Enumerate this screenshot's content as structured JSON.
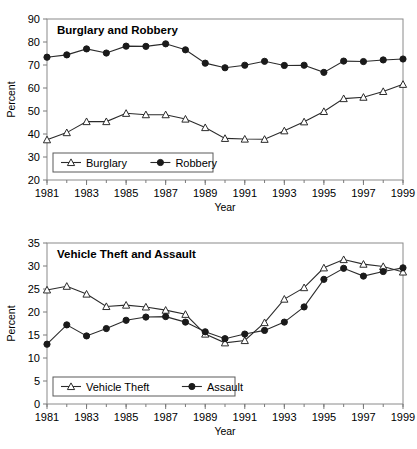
{
  "figure": {
    "background": "#ffffff",
    "width": 417,
    "height": 449,
    "line_color": "#2b2b2b",
    "marker_open_fill": "#ffffff",
    "marker_filled_fill": "#1a1a1a",
    "axis_color": "#7a7a7a"
  },
  "chart_data": [
    {
      "type": "line",
      "title": "Burglary and Robbery",
      "xlabel": "Year",
      "ylabel": "Percent",
      "x": [
        1981,
        1982,
        1983,
        1984,
        1985,
        1986,
        1987,
        1988,
        1989,
        1990,
        1991,
        1992,
        1993,
        1994,
        1995,
        1996,
        1997,
        1998,
        1999
      ],
      "xticklabels": [
        "1981",
        "1983",
        "1985",
        "1987",
        "1989",
        "1991",
        "1993",
        "1995",
        "1997",
        "1999"
      ],
      "xtickvalues": [
        1981,
        1983,
        1985,
        1987,
        1989,
        1991,
        1993,
        1995,
        1997,
        1999
      ],
      "xlim": [
        1981,
        1999
      ],
      "ylim": [
        20,
        90
      ],
      "yticks": [
        20,
        30,
        40,
        50,
        60,
        70,
        80,
        90
      ],
      "yticklabels": [
        "20",
        "30",
        "40",
        "50",
        "60",
        "70",
        "80",
        "90"
      ],
      "grid": false,
      "legend_position": "lower-left",
      "series": [
        {
          "name": "Burglary",
          "marker": "open-triangle",
          "values": [
            37.5,
            40.6,
            45.4,
            45.4,
            49.0,
            48.4,
            48.4,
            46.5,
            42.8,
            38.1,
            37.8,
            37.7,
            41.4,
            45.3,
            49.8,
            55.4,
            56.0,
            58.5,
            61.6
          ]
        },
        {
          "name": "Robbery",
          "marker": "filled-circle",
          "values": [
            73.4,
            74.4,
            77.0,
            75.2,
            78.2,
            78.1,
            79.2,
            76.6,
            70.8,
            68.8,
            69.9,
            71.6,
            69.8,
            69.9,
            66.8,
            71.7,
            71.5,
            72.2,
            72.6
          ]
        }
      ]
    },
    {
      "type": "line",
      "title": "Vehicle Theft and Assault",
      "xlabel": "Year",
      "ylabel": "Percent",
      "x": [
        1981,
        1982,
        1983,
        1984,
        1985,
        1986,
        1987,
        1988,
        1989,
        1990,
        1991,
        1992,
        1993,
        1994,
        1995,
        1996,
        1997,
        1998,
        1999
      ],
      "xticklabels": [
        "1981",
        "1983",
        "1985",
        "1987",
        "1989",
        "1991",
        "1993",
        "1995",
        "1997",
        "1999"
      ],
      "xtickvalues": [
        1981,
        1983,
        1985,
        1987,
        1989,
        1991,
        1993,
        1995,
        1997,
        1999
      ],
      "xlim": [
        1981,
        1999
      ],
      "ylim": [
        0,
        35
      ],
      "yticks": [
        0,
        5,
        10,
        15,
        20,
        25,
        30,
        35
      ],
      "yticklabels": [
        "0",
        "5",
        "10",
        "15",
        "20",
        "25",
        "30",
        "35"
      ],
      "grid": false,
      "legend_position": "lower-left",
      "series": [
        {
          "name": "Vehicle Theft",
          "marker": "open-triangle",
          "values": [
            24.8,
            25.6,
            23.9,
            21.2,
            21.5,
            21.1,
            20.4,
            19.5,
            15.2,
            13.3,
            13.8,
            17.7,
            22.8,
            25.3,
            29.6,
            31.4,
            30.4,
            29.9,
            28.7
          ]
        },
        {
          "name": "Assault",
          "marker": "filled-circle",
          "values": [
            13.0,
            17.2,
            14.8,
            16.4,
            18.2,
            18.9,
            19.0,
            17.8,
            15.7,
            14.2,
            15.2,
            16.0,
            17.8,
            21.1,
            27.1,
            29.5,
            27.8,
            28.8,
            29.6
          ]
        }
      ]
    }
  ]
}
